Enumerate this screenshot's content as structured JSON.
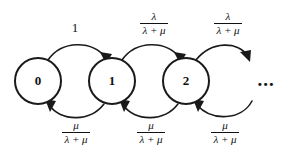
{
  "diagram": {
    "type": "markov-chain-state-diagram",
    "title": "",
    "background_color": "#ffffff",
    "stroke_color": "#1a1a1a",
    "states": [
      {
        "id": "state-0",
        "label": "0",
        "cx": 38,
        "cy": 81,
        "r": 23
      },
      {
        "id": "state-1",
        "label": "1",
        "cx": 112,
        "cy": 81,
        "r": 23
      },
      {
        "id": "state-2",
        "label": "2",
        "cx": 186,
        "cy": 81,
        "r": 23
      },
      {
        "id": "state-ellipsis",
        "label": "...",
        "cx": 266,
        "cy": 81,
        "r": 0
      }
    ],
    "transitions": [
      {
        "id": "t-0-to-1",
        "from": "0",
        "to": "1",
        "direction": "forward",
        "position": "top",
        "label_kind": "scalar",
        "numerator": "1",
        "denominator": "",
        "label_text": "1",
        "label_x": 75,
        "label_y": 28
      },
      {
        "id": "t-1-to-2",
        "from": "1",
        "to": "2",
        "direction": "forward",
        "position": "top",
        "label_kind": "fraction",
        "numerator": "λ",
        "denominator": "λ + μ",
        "label_text": "λ / (λ + μ)",
        "label_x": 153,
        "label_y": 24
      },
      {
        "id": "t-2-to-next",
        "from": "2",
        "to": "...",
        "direction": "forward",
        "position": "top",
        "label_kind": "fraction",
        "numerator": "λ",
        "denominator": "λ + μ",
        "label_text": "λ / (λ + μ)",
        "label_x": 227,
        "label_y": 24
      },
      {
        "id": "t-1-to-0",
        "from": "1",
        "to": "0",
        "direction": "backward",
        "position": "bottom",
        "label_kind": "fraction",
        "numerator": "μ",
        "denominator": "λ + μ",
        "label_text": "μ / (λ + μ)",
        "label_x": 75,
        "label_y": 133
      },
      {
        "id": "t-2-to-1",
        "from": "2",
        "to": "1",
        "direction": "backward",
        "position": "bottom",
        "label_kind": "fraction",
        "numerator": "μ",
        "denominator": "λ + μ",
        "label_text": "μ / (λ + μ)",
        "label_x": 150,
        "label_y": 133
      },
      {
        "id": "t-next-to-2",
        "from": "...",
        "to": "2",
        "direction": "backward",
        "position": "bottom",
        "label_kind": "fraction",
        "numerator": "μ",
        "denominator": "λ + μ",
        "label_text": "μ / (λ + μ)",
        "label_x": 224,
        "label_y": 133
      }
    ]
  }
}
